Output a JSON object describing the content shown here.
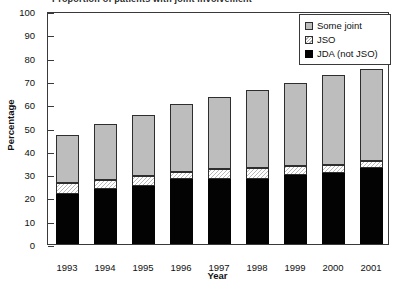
{
  "figure": {
    "clipped_title": "Proportion of patients with joint involvement"
  },
  "axes": {
    "ylabel": "Percentage",
    "xlabel": "Year",
    "y_ticks": [
      0,
      10,
      20,
      30,
      40,
      50,
      60,
      70,
      80,
      90,
      100
    ],
    "y_min": 0,
    "y_max": 100
  },
  "legend": {
    "items": [
      {
        "label": "Some joint",
        "swatch": "gray-swatch-icon",
        "color": "#bdbdbd"
      },
      {
        "label": "JSO",
        "swatch": "hatched-swatch-icon",
        "color": "#ffffff"
      },
      {
        "label": "JDA (not JSO)",
        "swatch": "black-swatch-icon",
        "color": "#030303"
      }
    ]
  },
  "chart_data": {
    "type": "bar",
    "stacked": true,
    "title": "Proportion of patients with joint involvement",
    "xlabel": "Year",
    "ylabel": "Percentage",
    "ylim": [
      0,
      100
    ],
    "ytick_step": 10,
    "grid": false,
    "legend_position": "top-right",
    "categories": [
      "1993",
      "1994",
      "1995",
      "1996",
      "1997",
      "1998",
      "1999",
      "2000",
      "2001"
    ],
    "series": [
      {
        "name": "JDA (not JSO)",
        "color": "#030303",
        "values": [
          21.5,
          23.5,
          25.0,
          28.0,
          28.0,
          28.0,
          29.5,
          30.5,
          32.5
        ]
      },
      {
        "name": "JSO",
        "color": "#ffffff",
        "pattern": "diagonal-hatch",
        "values": [
          4.5,
          4.0,
          4.0,
          3.0,
          4.0,
          4.5,
          4.0,
          3.5,
          3.0
        ]
      },
      {
        "name": "Some joint",
        "color": "#bdbdbd",
        "values": [
          21.0,
          24.0,
          26.5,
          29.0,
          31.0,
          33.5,
          35.5,
          38.5,
          39.5
        ]
      }
    ],
    "totals": [
      47.0,
      51.5,
      55.5,
      60.0,
      63.0,
      66.0,
      69.0,
      72.5,
      75.0
    ],
    "cumulative_tops": {
      "jda": [
        21.5,
        23.5,
        25.0,
        28.0,
        28.0,
        28.0,
        29.5,
        30.5,
        32.5
      ],
      "jso": [
        26.0,
        27.5,
        29.0,
        31.0,
        32.0,
        32.5,
        33.5,
        34.0,
        35.5
      ],
      "some": [
        47.0,
        51.5,
        55.5,
        60.0,
        63.0,
        66.0,
        69.0,
        72.5,
        75.0
      ]
    }
  }
}
